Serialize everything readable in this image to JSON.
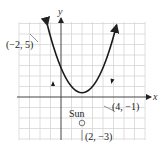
{
  "diagram": {
    "type": "parabolic orbit graph",
    "axes": {
      "x_label": "x",
      "y_label": "y"
    },
    "grid": {
      "x_min": -4,
      "x_max": 8,
      "y_min": -4,
      "y_max": 7,
      "step": 1
    },
    "curve": {
      "equation": "y = (x - 2)^2 - 3",
      "color": "#1a1a1a"
    },
    "focus_label": "Sun",
    "points": [
      {
        "label": "(−2, 5)",
        "x": -2,
        "y": 5
      },
      {
        "label": "(4, −1)",
        "x": 4,
        "y": -1
      },
      {
        "label": "(2, −3)",
        "x": 2,
        "y": -3
      }
    ]
  }
}
